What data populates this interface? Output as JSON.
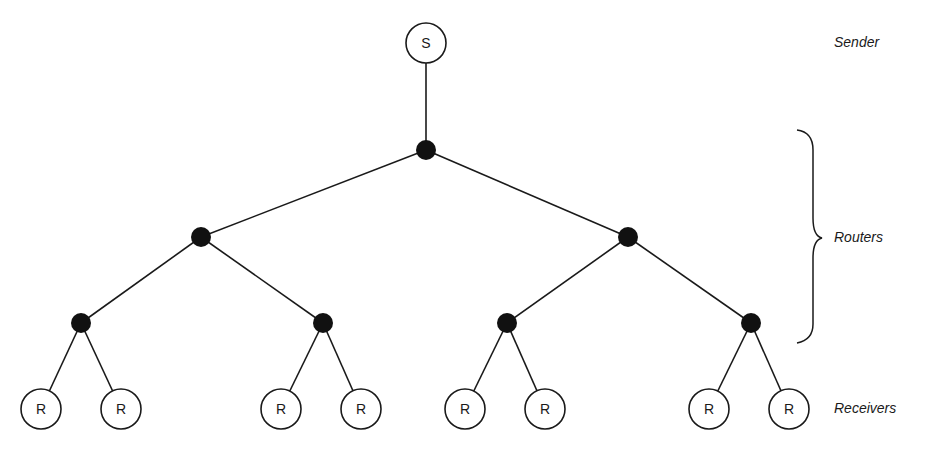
{
  "labels": {
    "sender": "Sender",
    "routers": "Routers",
    "receivers": "Receivers"
  },
  "sender": {
    "id": "S",
    "label": "S",
    "x": 426,
    "y": 43
  },
  "routers": [
    {
      "id": "r0",
      "x": 426,
      "y": 150
    },
    {
      "id": "r1",
      "x": 201,
      "y": 237
    },
    {
      "id": "r2",
      "x": 628,
      "y": 237
    },
    {
      "id": "r3",
      "x": 81,
      "y": 323
    },
    {
      "id": "r4",
      "x": 323,
      "y": 323
    },
    {
      "id": "r5",
      "x": 507,
      "y": 323
    },
    {
      "id": "r6",
      "x": 751,
      "y": 323
    }
  ],
  "receivers": [
    {
      "id": "R1",
      "label": "R",
      "x": 41,
      "y": 409
    },
    {
      "id": "R2",
      "label": "R",
      "x": 121,
      "y": 409
    },
    {
      "id": "R3",
      "label": "R",
      "x": 281,
      "y": 409
    },
    {
      "id": "R4",
      "label": "R",
      "x": 361,
      "y": 409
    },
    {
      "id": "R5",
      "label": "R",
      "x": 465,
      "y": 409
    },
    {
      "id": "R6",
      "label": "R",
      "x": 545,
      "y": 409
    },
    {
      "id": "R7",
      "label": "R",
      "x": 709,
      "y": 409
    },
    {
      "id": "R8",
      "label": "R",
      "x": 789,
      "y": 409
    }
  ],
  "edges": [
    [
      "S",
      "r0"
    ],
    [
      "r0",
      "r1"
    ],
    [
      "r0",
      "r2"
    ],
    [
      "r1",
      "r3"
    ],
    [
      "r1",
      "r4"
    ],
    [
      "r2",
      "r5"
    ],
    [
      "r2",
      "r6"
    ],
    [
      "r3",
      "R1"
    ],
    [
      "r3",
      "R2"
    ],
    [
      "r4",
      "R3"
    ],
    [
      "r4",
      "R4"
    ],
    [
      "r5",
      "R5"
    ],
    [
      "r5",
      "R6"
    ],
    [
      "r6",
      "R7"
    ],
    [
      "r6",
      "R8"
    ]
  ],
  "style": {
    "ink": "#1a1a1a",
    "router_fill": "#111111",
    "background": "#ffffff"
  }
}
